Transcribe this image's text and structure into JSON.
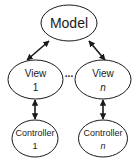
{
  "diagram": {
    "colors": {
      "stroke": "#1a1a1a",
      "fill": "#ffffff",
      "text": "#1a1a1a"
    },
    "nodes": {
      "model": {
        "line1": "Model"
      },
      "view_1": {
        "line1": "View",
        "line2": "1"
      },
      "view_n": {
        "line1": "View",
        "line2": "n"
      },
      "controller_1": {
        "line1": "Controller",
        "line2": "1"
      },
      "controller_n": {
        "line1": "Controller",
        "line2": "n"
      }
    },
    "ellipsis": "...",
    "edges": [
      {
        "from": "model",
        "to": "view_1",
        "type": "bidirectional"
      },
      {
        "from": "model",
        "to": "view_n",
        "type": "bidirectional"
      },
      {
        "from": "view_1",
        "to": "controller_1",
        "type": "bidirectional"
      },
      {
        "from": "view_n",
        "to": "controller_n",
        "type": "bidirectional"
      }
    ]
  }
}
